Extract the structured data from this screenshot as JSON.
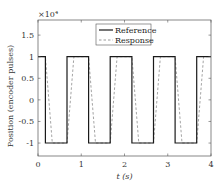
{
  "chart_data": {
    "type": "line",
    "title": "",
    "xlabel": "t (s)",
    "ylabel": "Position (encoder pulses)",
    "y_multiplier": "×10⁴",
    "xlim": [
      0,
      4
    ],
    "ylim": [
      -1.3,
      1.85
    ],
    "xticks": [
      0,
      1,
      2,
      3,
      4
    ],
    "xtick_labels": [
      "0",
      "1",
      "2",
      "3",
      "4"
    ],
    "yticks": [
      -1,
      -0.5,
      0,
      0.5,
      1,
      1.5
    ],
    "ytick_labels": [
      "-1",
      "-0.5",
      "0",
      "0.5",
      "1",
      "1.5"
    ],
    "grid": false,
    "legend_position": "upper center",
    "series": [
      {
        "name": "Reference",
        "style": "solid",
        "color": "#1a1a1a",
        "x": [
          0,
          0.17,
          0.17,
          0.67,
          0.67,
          1.17,
          1.17,
          1.67,
          1.67,
          2.17,
          2.17,
          2.67,
          2.67,
          3.17,
          3.17,
          3.67,
          3.67,
          4.0
        ],
        "y": [
          1,
          1,
          -1,
          -1,
          1,
          1,
          -1,
          -1,
          1,
          1,
          -1,
          -1,
          1,
          1,
          -1,
          -1,
          1,
          1
        ]
      },
      {
        "name": "Response",
        "style": "dashed",
        "color": "#9a9a9a",
        "x": [
          0,
          0.17,
          0.33,
          0.67,
          0.83,
          1.17,
          1.33,
          1.67,
          1.83,
          2.17,
          2.33,
          2.67,
          2.83,
          3.17,
          3.33,
          3.67,
          3.83,
          4.0
        ],
        "y": [
          1,
          1,
          -1,
          -1,
          1,
          1,
          -1,
          -1,
          1,
          1,
          -1,
          -1,
          1,
          1,
          -1,
          -1,
          1,
          1
        ]
      }
    ]
  },
  "layout": {
    "plot": {
      "left": 38,
      "right": 211,
      "top": 20,
      "bottom": 156
    }
  }
}
